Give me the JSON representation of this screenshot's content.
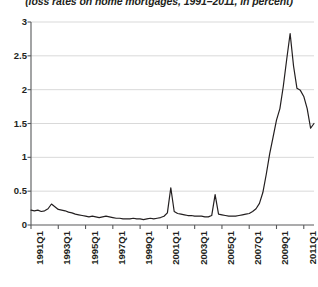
{
  "chart": {
    "title": "(loss rates on home mortgages, 1991–2011, in percent)"
  },
  "chart_data": {
    "type": "line",
    "title": "(loss rates on home mortgages, 1991–2011, in percent)",
    "subtitle": "",
    "xlabel": "",
    "ylabel": "",
    "units": "percent",
    "grid": "horizontal",
    "legend": "none",
    "line_color": "#231f20",
    "grid_color": "#d9d9d9",
    "axis_color": "#58595b",
    "ylim": [
      0,
      3
    ],
    "yticks": [
      0,
      0.5,
      1,
      1.5,
      2,
      2.5,
      3
    ],
    "ytick_labels": [
      "0",
      "0.5",
      "1",
      "1.5",
      "2",
      "2.5",
      "3"
    ],
    "xlim": [
      "1991Q1",
      "2011Q4"
    ],
    "xtick_labels": [
      "1991Q1",
      "1993Q1",
      "1995Q1",
      "1997Q1",
      "1999Q1",
      "2001Q1",
      "2003Q1",
      "2005Q1",
      "2007Q1",
      "2009Q1",
      "2011Q1"
    ],
    "xtick_indices": [
      0,
      8,
      16,
      24,
      32,
      40,
      48,
      56,
      64,
      72,
      80
    ],
    "x": [
      "1991Q1",
      "1991Q2",
      "1991Q3",
      "1991Q4",
      "1992Q1",
      "1992Q2",
      "1992Q3",
      "1992Q4",
      "1993Q1",
      "1993Q2",
      "1993Q3",
      "1993Q4",
      "1994Q1",
      "1994Q2",
      "1994Q3",
      "1994Q4",
      "1995Q1",
      "1995Q2",
      "1995Q3",
      "1995Q4",
      "1996Q1",
      "1996Q2",
      "1996Q3",
      "1996Q4",
      "1997Q1",
      "1997Q2",
      "1997Q3",
      "1997Q4",
      "1998Q1",
      "1998Q2",
      "1998Q3",
      "1998Q4",
      "1999Q1",
      "1999Q2",
      "1999Q3",
      "1999Q4",
      "2000Q1",
      "2000Q2",
      "2000Q3",
      "2000Q4",
      "2001Q1",
      "2001Q2",
      "2001Q3",
      "2001Q4",
      "2002Q1",
      "2002Q2",
      "2002Q3",
      "2002Q4",
      "2003Q1",
      "2003Q2",
      "2003Q3",
      "2003Q4",
      "2004Q1",
      "2004Q2",
      "2004Q3",
      "2004Q4",
      "2005Q1",
      "2005Q2",
      "2005Q3",
      "2005Q4",
      "2006Q1",
      "2006Q2",
      "2006Q3",
      "2006Q4",
      "2007Q1",
      "2007Q2",
      "2007Q3",
      "2007Q4",
      "2008Q1",
      "2008Q2",
      "2008Q3",
      "2008Q4",
      "2009Q1",
      "2009Q2",
      "2009Q3",
      "2009Q4",
      "2010Q1",
      "2010Q2",
      "2010Q3",
      "2010Q4",
      "2011Q1",
      "2011Q2",
      "2011Q3",
      "2011Q4"
    ],
    "series": [
      {
        "name": "Loss rate on home mortgages",
        "values": [
          0.22,
          0.21,
          0.22,
          0.2,
          0.21,
          0.24,
          0.31,
          0.27,
          0.23,
          0.22,
          0.21,
          0.19,
          0.18,
          0.16,
          0.15,
          0.14,
          0.13,
          0.12,
          0.13,
          0.12,
          0.11,
          0.12,
          0.13,
          0.12,
          0.11,
          0.1,
          0.1,
          0.09,
          0.09,
          0.09,
          0.1,
          0.09,
          0.09,
          0.08,
          0.09,
          0.1,
          0.09,
          0.1,
          0.11,
          0.13,
          0.18,
          0.55,
          0.2,
          0.17,
          0.16,
          0.15,
          0.14,
          0.14,
          0.13,
          0.13,
          0.13,
          0.12,
          0.12,
          0.14,
          0.45,
          0.16,
          0.15,
          0.14,
          0.13,
          0.13,
          0.13,
          0.14,
          0.15,
          0.16,
          0.17,
          0.2,
          0.24,
          0.32,
          0.48,
          0.75,
          1.05,
          1.3,
          1.55,
          1.72,
          2.05,
          2.45,
          2.83,
          2.35,
          2.02,
          1.99,
          1.9,
          1.72,
          1.43,
          1.5
        ]
      }
    ],
    "annotations": [
      {
        "label": "spike",
        "x": "2001Q2",
        "value": 0.55
      },
      {
        "label": "spike",
        "x": "2004Q3",
        "value": 0.45
      },
      {
        "label": "peak",
        "x": "2010Q1",
        "value": 2.83
      }
    ]
  }
}
